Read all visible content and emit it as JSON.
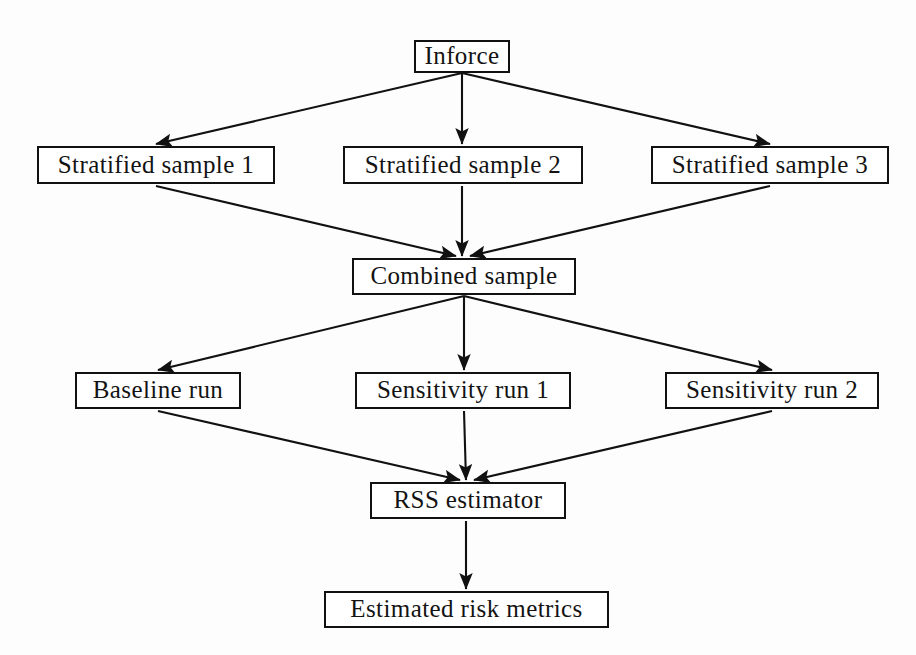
{
  "diagram": {
    "background_color": "#fdfdfd",
    "node_fill": "#ffffff",
    "stroke_color": "#111111",
    "text_color": "#131313",
    "nodes": [
      {
        "id": "inforce",
        "label": "Inforce"
      },
      {
        "id": "strat1",
        "label": "Stratified sample 1"
      },
      {
        "id": "strat2",
        "label": "Stratified sample 2"
      },
      {
        "id": "strat3",
        "label": "Stratified sample 3"
      },
      {
        "id": "combined",
        "label": "Combined sample"
      },
      {
        "id": "baseline",
        "label": "Baseline run"
      },
      {
        "id": "sens1",
        "label": "Sensitivity run 1"
      },
      {
        "id": "sens2",
        "label": "Sensitivity run 2"
      },
      {
        "id": "rss",
        "label": "RSS estimator"
      },
      {
        "id": "metrics",
        "label": "Estimated risk metrics"
      }
    ],
    "edges": [
      {
        "from": "inforce",
        "to": "strat1",
        "x1": 462,
        "y1": 73,
        "x2": 156,
        "y2": 144
      },
      {
        "from": "inforce",
        "to": "strat2",
        "x1": 462,
        "y1": 73,
        "x2": 462,
        "y2": 144
      },
      {
        "from": "inforce",
        "to": "strat3",
        "x1": 462,
        "y1": 73,
        "x2": 770,
        "y2": 144
      },
      {
        "from": "strat1",
        "to": "combined",
        "x1": 156,
        "y1": 186,
        "x2": 456,
        "y2": 256
      },
      {
        "from": "strat2",
        "to": "combined",
        "x1": 462,
        "y1": 186,
        "x2": 462,
        "y2": 256
      },
      {
        "from": "strat3",
        "to": "combined",
        "x1": 770,
        "y1": 186,
        "x2": 470,
        "y2": 256
      },
      {
        "from": "combined",
        "to": "baseline",
        "x1": 464,
        "y1": 296,
        "x2": 158,
        "y2": 370
      },
      {
        "from": "combined",
        "to": "sens1",
        "x1": 464,
        "y1": 296,
        "x2": 464,
        "y2": 370
      },
      {
        "from": "combined",
        "to": "sens2",
        "x1": 464,
        "y1": 296,
        "x2": 772,
        "y2": 370
      },
      {
        "from": "baseline",
        "to": "rss",
        "x1": 158,
        "y1": 411,
        "x2": 460,
        "y2": 480
      },
      {
        "from": "sens1",
        "to": "rss",
        "x1": 464,
        "y1": 411,
        "x2": 466,
        "y2": 480
      },
      {
        "from": "sens2",
        "to": "rss",
        "x1": 772,
        "y1": 411,
        "x2": 474,
        "y2": 480
      },
      {
        "from": "rss",
        "to": "metrics",
        "x1": 466,
        "y1": 521,
        "x2": 466,
        "y2": 589
      }
    ]
  }
}
